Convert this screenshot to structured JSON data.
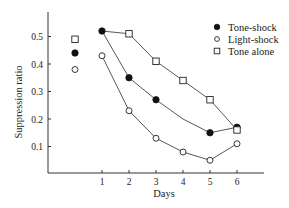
{
  "chart_data": {
    "type": "line",
    "title": "",
    "xlabel": "Days",
    "ylabel": "Suppression ratio",
    "x": [
      1,
      2,
      3,
      4,
      5,
      6
    ],
    "x_ticks": [
      "1",
      "2",
      "3",
      "4",
      "5",
      "6"
    ],
    "y_ticks": [
      "0.1",
      "0.2",
      "0.3",
      "0.4",
      "0.5"
    ],
    "ylim": [
      0,
      0.58
    ],
    "grid": false,
    "legend_position": "upper right",
    "baseline": {
      "description": "unconnected pre-training points left of day 1",
      "Tone-shock": 0.44,
      "Light-shock": 0.38,
      "Tone alone": 0.49
    },
    "series": [
      {
        "name": "Tone-shock",
        "marker": "filled-circle",
        "values": [
          0.52,
          0.35,
          0.27,
          0.2,
          0.15,
          0.17
        ],
        "markers_shown": [
          true,
          true,
          true,
          false,
          true,
          true
        ]
      },
      {
        "name": "Light-shock",
        "marker": "open-circle",
        "values": [
          0.43,
          0.23,
          0.13,
          0.08,
          0.05,
          0.11
        ],
        "markers_shown": [
          true,
          true,
          true,
          true,
          true,
          true
        ]
      },
      {
        "name": "Tone alone",
        "marker": "open-square",
        "values": [
          null,
          0.51,
          0.41,
          0.34,
          0.27,
          0.16
        ],
        "markers_shown": [
          false,
          true,
          true,
          true,
          true,
          true
        ],
        "line_starts_from": "Tone-shock day 1 point"
      }
    ]
  },
  "legend": {
    "items": [
      {
        "label": "Tone-shock"
      },
      {
        "label": "Light-shock"
      },
      {
        "label": "Tone alone"
      }
    ]
  }
}
